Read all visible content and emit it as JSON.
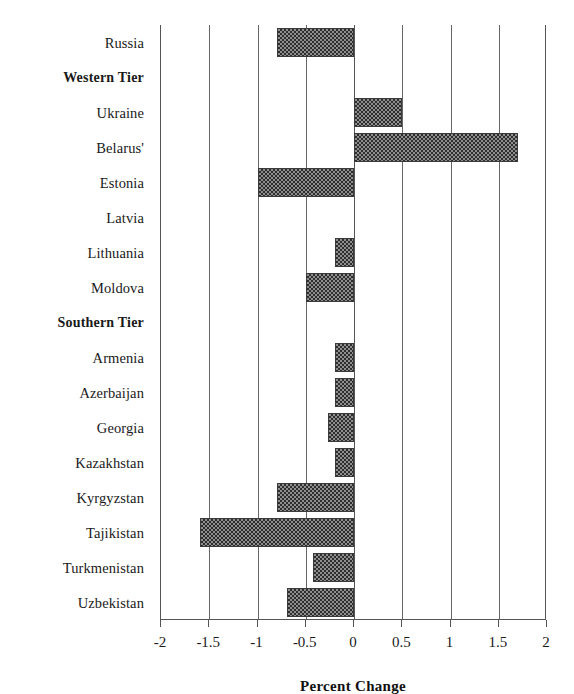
{
  "chart_data": {
    "type": "bar",
    "orientation": "horizontal",
    "title": "",
    "xlabel": "Percent Change",
    "ylabel": "",
    "xlim": [
      -2,
      2
    ],
    "xticks": [
      -2,
      -1.5,
      -1,
      -0.5,
      0,
      0.5,
      1,
      1.5,
      2
    ],
    "xtick_labels": [
      "-2",
      "-1.5",
      "-1",
      "-0.5",
      "0",
      "0.5",
      "1",
      "1.5",
      "2"
    ],
    "grid": true,
    "grid_axis": "x",
    "legend": null,
    "bar_fill": "#4a4a4a",
    "rows": [
      {
        "label": "Russia",
        "value": -0.8,
        "is_group": false,
        "has_bar": true
      },
      {
        "label": "Western Tier",
        "value": null,
        "is_group": true,
        "has_bar": false
      },
      {
        "label": "Ukraine",
        "value": 0.5,
        "is_group": false,
        "has_bar": true
      },
      {
        "label": "Belarus'",
        "value": 1.7,
        "is_group": false,
        "has_bar": true
      },
      {
        "label": "Estonia",
        "value": -1.0,
        "is_group": false,
        "has_bar": true
      },
      {
        "label": "Latvia",
        "value": 0.0,
        "is_group": false,
        "has_bar": false
      },
      {
        "label": "Lithuania",
        "value": -0.2,
        "is_group": false,
        "has_bar": true
      },
      {
        "label": "Moldova",
        "value": -0.5,
        "is_group": false,
        "has_bar": true
      },
      {
        "label": "Southern Tier",
        "value": null,
        "is_group": true,
        "has_bar": false
      },
      {
        "label": "Armenia",
        "value": -0.2,
        "is_group": false,
        "has_bar": true
      },
      {
        "label": "Azerbaijan",
        "value": -0.2,
        "is_group": false,
        "has_bar": true
      },
      {
        "label": "Georgia",
        "value": -0.27,
        "is_group": false,
        "has_bar": true
      },
      {
        "label": "Kazakhstan",
        "value": -0.2,
        "is_group": false,
        "has_bar": true
      },
      {
        "label": "Kyrgyzstan",
        "value": -0.8,
        "is_group": false,
        "has_bar": true
      },
      {
        "label": "Tajikistan",
        "value": -1.6,
        "is_group": false,
        "has_bar": true
      },
      {
        "label": "Turkmenistan",
        "value": -0.43,
        "is_group": false,
        "has_bar": true
      },
      {
        "label": "Uzbekistan",
        "value": -0.69,
        "is_group": false,
        "has_bar": true
      }
    ]
  }
}
